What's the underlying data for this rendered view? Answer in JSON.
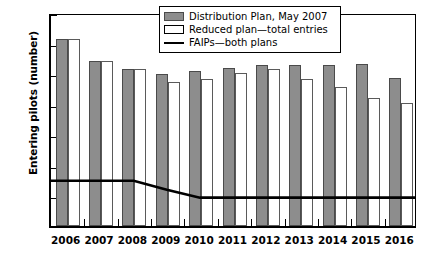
{
  "chart_data": {
    "type": "bar",
    "title": "",
    "xlabel": "",
    "ylabel": "Entering pilots (number)",
    "categories": [
      "2006",
      "2007",
      "2008",
      "2009",
      "2010",
      "2011",
      "2012",
      "2013",
      "2014",
      "2015",
      "2016"
    ],
    "ylim": [
      0,
      350
    ],
    "yticks": [
      0,
      50,
      100,
      150,
      200,
      250,
      300,
      350
    ],
    "ytick_labels": [
      "0",
      "50",
      "100",
      "150",
      "200",
      "250",
      "300",
      "350"
    ],
    "grid": false,
    "legend_position": "top-center",
    "series": [
      {
        "name": "Distribution Plan, May 2007",
        "kind": "bar",
        "color": "#8d8d8d",
        "values": [
          306,
          270,
          256,
          249,
          253,
          258,
          264,
          263,
          263,
          265,
          242
        ]
      },
      {
        "name": "Reduced plan—total entries",
        "kind": "bar",
        "color": "#ffffff",
        "values": [
          306,
          270,
          256,
          236,
          241,
          250,
          256,
          241,
          227,
          209,
          202
        ]
      },
      {
        "name": "FAIPs—both plans",
        "kind": "line",
        "color": "#000000",
        "values": [
          75,
          75,
          75,
          60,
          47,
          47,
          47,
          47,
          47,
          47,
          47
        ]
      }
    ]
  },
  "legend": {
    "items": [
      {
        "label": "Distribution Plan, May 2007",
        "swatch": "gray-swatch"
      },
      {
        "label": "Reduced plan—total entries",
        "swatch": "white-swatch"
      },
      {
        "label": "FAIPs—both plans",
        "swatch": "line-swatch"
      }
    ]
  },
  "axes": {
    "y_title": "Entering pilots (number)"
  }
}
